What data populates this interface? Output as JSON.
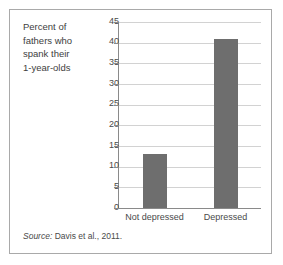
{
  "figure": {
    "axis_caption_lines": [
      "Percent of",
      "fathers who",
      "spank their",
      "1-year-olds"
    ],
    "source_prefix": "Source:",
    "source_text": " Davis et al., 2011."
  },
  "colors": {
    "bar_fill": "#6e6e6e",
    "gridline": "#d2d2d2",
    "axis_line": "#8a8a8a",
    "frame_border": "#a9a9a9",
    "text": "#4a4a4a",
    "background": "#ffffff"
  },
  "chart_data": {
    "type": "bar",
    "title": "",
    "subtitle": "",
    "xlabel": "",
    "ylabel": "Percent of fathers who spank their 1-year-olds",
    "categories": [
      "Not depressed",
      "Depressed"
    ],
    "values": [
      13,
      41
    ],
    "ylim": [
      0,
      45
    ],
    "ytick_interval": 5,
    "yticks": [
      0,
      5,
      10,
      15,
      20,
      25,
      30,
      35,
      40,
      45
    ],
    "ytick_labels": [
      "0",
      "5",
      "10",
      "15",
      "20",
      "25",
      "30",
      "35",
      "40",
      "45"
    ],
    "grid": true,
    "grid_axis": "y",
    "legend": false,
    "legend_position": "none",
    "annotations": [
      "Source: Davis et al., 2011."
    ]
  }
}
